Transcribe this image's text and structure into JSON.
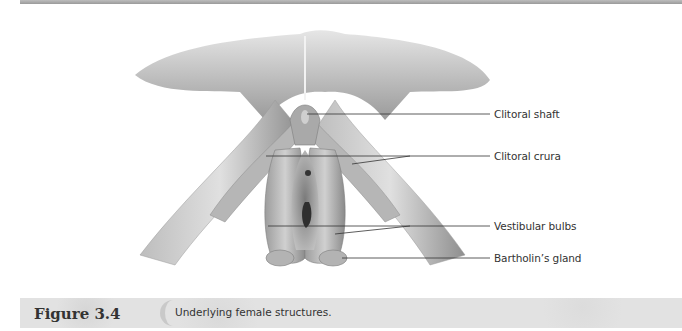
{
  "figure": {
    "number": "Figure 3.4",
    "caption": "Underlying female structures."
  },
  "labels": [
    {
      "id": "clitoral-shaft",
      "text": "Clitoral shaft"
    },
    {
      "id": "clitoral-crura",
      "text": "Clitoral crura"
    },
    {
      "id": "vestibular-bulbs",
      "text": "Vestibular bulbs"
    },
    {
      "id": "bartholins-gland",
      "text": "Bartholin’s gland"
    }
  ],
  "colors": {
    "tissue_light": "#d9d9d9",
    "tissue_mid": "#a8a8a8",
    "tissue_dark": "#6e6e6e",
    "leader_line": "#333333",
    "caption_bar": "#e2e2e2"
  }
}
